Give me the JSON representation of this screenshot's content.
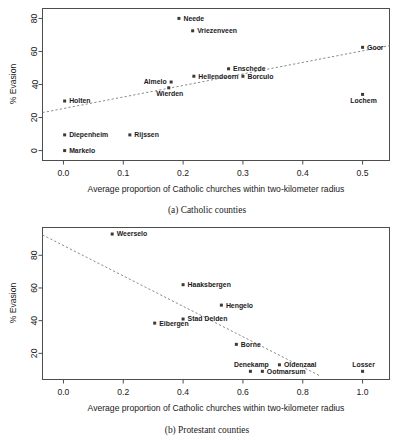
{
  "chart_data": [
    {
      "type": "scatter",
      "panel_id": "a",
      "caption": "(a) Catholic counties",
      "xlabel": "Average proportion of Catholic churches within two-kilometer radius",
      "ylabel": "% Evasion",
      "xlim": [
        -0.035,
        0.545
      ],
      "ylim": [
        -6,
        86
      ],
      "xticks": [
        0.0,
        0.1,
        0.2,
        0.3,
        0.4,
        0.5
      ],
      "xticklabels": [
        "0.0",
        "0.1",
        "0.2",
        "0.3",
        "0.4",
        "0.5"
      ],
      "yticks": [
        0,
        20,
        40,
        60,
        80
      ],
      "yticklabels": [
        "0",
        "20",
        "40",
        "60",
        "80"
      ],
      "grid": false,
      "legend": "none",
      "fit_line": {
        "style": "dashed",
        "x": [
          -0.035,
          0.545
        ],
        "y": [
          23.0,
          63.5
        ]
      },
      "points": [
        {
          "label": "Neede",
          "x": 0.193,
          "y": 80.0,
          "label_pos": "right"
        },
        {
          "label": "Vriezenveen",
          "x": 0.216,
          "y": 72.5,
          "label_pos": "right"
        },
        {
          "label": "Goor",
          "x": 0.5,
          "y": 62.5,
          "label_pos": "right"
        },
        {
          "label": "Enschede",
          "x": 0.276,
          "y": 49.5,
          "label_pos": "right"
        },
        {
          "label": "Hellendoorn",
          "x": 0.218,
          "y": 45.0,
          "label_pos": "right"
        },
        {
          "label": "Borculo",
          "x": 0.3,
          "y": 45.0,
          "label_pos": "right"
        },
        {
          "label": "Almelo",
          "x": 0.18,
          "y": 41.5,
          "label_pos": "left"
        },
        {
          "label": "Wierden",
          "x": 0.176,
          "y": 38.0,
          "label_pos": "below"
        },
        {
          "label": "Lochem",
          "x": 0.5,
          "y": 34.0,
          "label_pos": "below"
        },
        {
          "label": "Holten",
          "x": 0.002,
          "y": 30.0,
          "label_pos": "right"
        },
        {
          "label": "Rijssen",
          "x": 0.111,
          "y": 9.5,
          "label_pos": "right"
        },
        {
          "label": "Diepenheim",
          "x": 0.002,
          "y": 9.5,
          "label_pos": "right"
        },
        {
          "label": "Markelo",
          "x": 0.002,
          "y": 0.0,
          "label_pos": "right"
        }
      ]
    },
    {
      "type": "scatter",
      "panel_id": "b",
      "caption": "(b) Protestant counties",
      "xlabel": "Average proportion of Catholic churches within two-kilometer radius",
      "ylabel": "% Evasion",
      "xlim": [
        -0.07,
        1.09
      ],
      "ylim": [
        4,
        97
      ],
      "xticks": [
        0.0,
        0.2,
        0.4,
        0.6,
        0.8,
        1.0
      ],
      "xticklabels": [
        "0.0",
        "0.2",
        "0.4",
        "0.6",
        "0.8",
        "1.0"
      ],
      "yticks": [
        20,
        40,
        60,
        80
      ],
      "yticklabels": [
        "20",
        "40",
        "60",
        "80"
      ],
      "grid": false,
      "legend": "none",
      "fit_line": {
        "style": "dashed",
        "x": [
          -0.07,
          0.86
        ],
        "y": [
          92.5,
          6.0
        ]
      },
      "points": [
        {
          "label": "Weerselo",
          "x": 0.163,
          "y": 93.0,
          "label_pos": "right"
        },
        {
          "label": "Haaksbergen",
          "x": 0.4,
          "y": 62.0,
          "label_pos": "right"
        },
        {
          "label": "Hengelo",
          "x": 0.528,
          "y": 49.5,
          "label_pos": "right"
        },
        {
          "label": "Stad Delden",
          "x": 0.4,
          "y": 41.0,
          "label_pos": "right"
        },
        {
          "label": "Eibergen",
          "x": 0.305,
          "y": 38.5,
          "label_pos": "right"
        },
        {
          "label": "Borne",
          "x": 0.578,
          "y": 25.5,
          "label_pos": "right"
        },
        {
          "label": "Oldenzaal",
          "x": 0.722,
          "y": 13.0,
          "label_pos": "right"
        },
        {
          "label": "Ootmarsum",
          "x": 0.665,
          "y": 9.0,
          "label_pos": "right"
        },
        {
          "label": "Denekamp",
          "x": 0.625,
          "y": 9.0,
          "label_pos": "above"
        },
        {
          "label": "Losser",
          "x": 1.0,
          "y": 9.0,
          "label_pos": "above"
        }
      ]
    }
  ]
}
